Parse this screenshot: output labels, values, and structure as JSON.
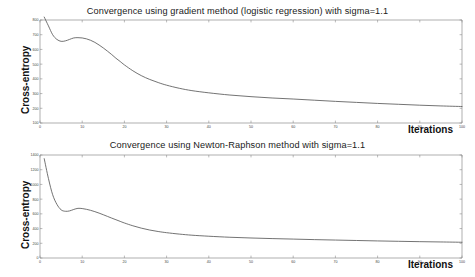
{
  "figure": {
    "background": "#ffffff",
    "axis_color": "#8c8c8c",
    "curve_color": "#5a5a5a"
  },
  "chart_data": [
    {
      "type": "line",
      "title": "Convergence using gradient method (logistic regression) with sigma=1.1",
      "xlabel": "Iterations",
      "ylabel": "Cross-entropy",
      "xlim": [
        0,
        100
      ],
      "ylim": [
        100,
        800
      ],
      "xticks": [
        0,
        10,
        20,
        30,
        40,
        50,
        60,
        70,
        80,
        90,
        100
      ],
      "xticklabels": [
        "0",
        "10",
        "20",
        "30",
        "40",
        "50",
        "60",
        "70",
        "80",
        "90",
        "100"
      ],
      "yticks": [
        100,
        200,
        300,
        400,
        500,
        600,
        700,
        800
      ],
      "yticklabels": [
        "100",
        "200",
        "300",
        "400",
        "500",
        "600",
        "700",
        "800"
      ],
      "grid": false,
      "legend": null,
      "series": [
        {
          "name": "gradient-method",
          "x": [
            1,
            2,
            3,
            4,
            5,
            6,
            7,
            8,
            9,
            10,
            11,
            12,
            13,
            14,
            15,
            16,
            17,
            18,
            19,
            20,
            22,
            24,
            26,
            28,
            30,
            33,
            36,
            40,
            45,
            50,
            55,
            60,
            65,
            70,
            75,
            80,
            85,
            90,
            95,
            100
          ],
          "values": [
            820,
            760,
            700,
            668,
            655,
            658,
            668,
            678,
            680,
            678,
            672,
            662,
            648,
            630,
            610,
            588,
            565,
            540,
            518,
            495,
            455,
            422,
            396,
            375,
            357,
            336,
            320,
            305,
            290,
            279,
            270,
            263,
            255,
            247,
            240,
            233,
            227,
            221,
            216,
            212
          ]
        }
      ]
    },
    {
      "type": "line",
      "title": "Convergence using Newton-Raphson method with sigma=1.1",
      "xlabel": "Iterations",
      "ylabel": "Cross-entropy",
      "xlim": [
        0,
        100
      ],
      "ylim": [
        0,
        1400
      ],
      "xticks": [
        0,
        10,
        20,
        30,
        40,
        50,
        60,
        70,
        80,
        90,
        100
      ],
      "xticklabels": [
        "0",
        "10",
        "20",
        "30",
        "40",
        "50",
        "60",
        "70",
        "80",
        "90",
        "100"
      ],
      "yticks": [
        0,
        200,
        400,
        600,
        800,
        1000,
        1200,
        1400
      ],
      "yticklabels": [
        "0",
        "200",
        "400",
        "600",
        "800",
        "1000",
        "1200",
        "1400"
      ],
      "grid": false,
      "legend": null,
      "series": [
        {
          "name": "newton-raphson-method",
          "x": [
            1,
            2,
            3,
            4,
            5,
            6,
            7,
            8,
            9,
            10,
            11,
            12,
            13,
            14,
            15,
            16,
            17,
            18,
            19,
            20,
            22,
            24,
            26,
            28,
            30,
            33,
            36,
            40,
            45,
            50,
            55,
            60,
            65,
            70,
            75,
            80,
            85,
            90,
            95,
            100
          ],
          "values": [
            1350,
            1080,
            860,
            730,
            655,
            635,
            640,
            660,
            675,
            672,
            662,
            648,
            630,
            610,
            588,
            565,
            542,
            520,
            498,
            476,
            438,
            406,
            380,
            360,
            344,
            325,
            310,
            296,
            282,
            272,
            264,
            257,
            250,
            244,
            238,
            232,
            227,
            222,
            218,
            214
          ]
        }
      ]
    }
  ]
}
